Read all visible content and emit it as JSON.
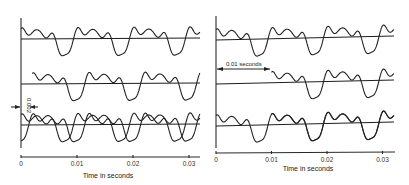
{
  "figure": {
    "panels": [
      {
        "id": "left",
        "xlabel": "Time in seconds",
        "tick_labels": [
          "0",
          "0.01",
          "0.02",
          "0.03"
        ],
        "tick_values": [
          0,
          0.01,
          0.02,
          0.03
        ],
        "shift_annotation": "0.002",
        "shift_seconds": 0.002,
        "traces": [
          {
            "name": "original",
            "delay_s": 0
          },
          {
            "name": "delayed",
            "delay_s": 0.002
          },
          {
            "name": "superposition",
            "components": [
              "original",
              "delayed"
            ]
          }
        ]
      },
      {
        "id": "right",
        "xlabel": "Time in seconds",
        "tick_labels": [
          "0",
          "0.01",
          "0.02",
          "0.03"
        ],
        "tick_values": [
          0,
          0.01,
          0.02,
          0.03
        ],
        "shift_annotation": "0.01 seconds",
        "shift_seconds": 0.01,
        "traces": [
          {
            "name": "original",
            "delay_s": 0
          },
          {
            "name": "delayed",
            "delay_s": 0.01
          },
          {
            "name": "superposition",
            "components": [
              "original",
              "delayed"
            ]
          }
        ]
      }
    ],
    "waveform": {
      "period_s": 0.01,
      "harmonics": [
        {
          "n": 1,
          "amp": 1.0,
          "phase": 0.0
        },
        {
          "n": 2,
          "amp": 0.55,
          "phase": 1.2
        },
        {
          "n": 3,
          "amp": 0.35,
          "phase": 2.4
        },
        {
          "n": 4,
          "amp": 0.22,
          "phase": 0.6
        },
        {
          "n": 5,
          "amp": 0.12,
          "phase": 1.9
        }
      ]
    }
  }
}
